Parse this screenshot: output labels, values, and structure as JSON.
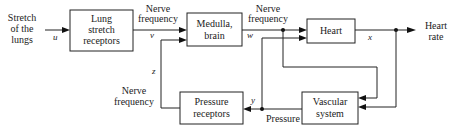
{
  "diagram": {
    "input": {
      "lines": [
        "Stretch",
        "of the",
        "lungs"
      ],
      "signal": "u"
    },
    "blocks": {
      "lung": {
        "lines": [
          "Lung",
          "stretch",
          "receptors"
        ]
      },
      "medulla": {
        "lines": [
          "Medulla,",
          "brain"
        ]
      },
      "heart": {
        "lines": [
          "Heart"
        ]
      },
      "pressure_receptors": {
        "lines": [
          "Pressure",
          "receptors"
        ]
      },
      "vascular": {
        "lines": [
          "Vascular",
          "system"
        ]
      }
    },
    "signals": {
      "v": {
        "label_lines": [
          "Nerve",
          "frequency"
        ],
        "var": "v"
      },
      "w": {
        "label_lines": [
          "Nerve",
          "frequency"
        ],
        "var": "w"
      },
      "x": {
        "var": "x"
      },
      "y": {
        "label": "Pressure",
        "var": "y"
      },
      "z": {
        "label_lines": [
          "Nerve",
          "frequency"
        ],
        "var": "z"
      }
    },
    "output": {
      "lines": [
        "Heart",
        "rate"
      ]
    }
  }
}
